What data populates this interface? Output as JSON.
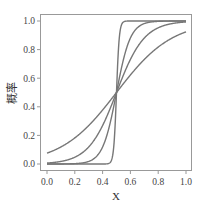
{
  "chart_data": {
    "type": "line",
    "title": "",
    "xlabel": "X",
    "ylabel": "概率",
    "xlim": [
      0.0,
      1.0
    ],
    "ylim": [
      0.0,
      1.0
    ],
    "x_ticks": [
      "0.0",
      "0.2",
      "0.4",
      "0.6",
      "0.8",
      "1.0"
    ],
    "y_ticks": [
      "0.0",
      "0.2",
      "0.4",
      "0.6",
      "0.8",
      "1.0"
    ],
    "grid": false,
    "legend": null,
    "line_color": "#777777",
    "function": "logistic sigmoid y = 1 / (1 + exp(-k (x - 0.5)))",
    "series": [
      {
        "name": "k=5",
        "k": 5,
        "x": [
          0.0,
          0.1,
          0.2,
          0.3,
          0.4,
          0.5,
          0.6,
          0.7,
          0.8,
          0.9,
          1.0
        ],
        "values": [
          0.076,
          0.119,
          0.182,
          0.269,
          0.378,
          0.5,
          0.622,
          0.731,
          0.818,
          0.881,
          0.924
        ]
      },
      {
        "name": "k=10",
        "k": 10,
        "x": [
          0.0,
          0.1,
          0.2,
          0.3,
          0.4,
          0.5,
          0.6,
          0.7,
          0.8,
          0.9,
          1.0
        ],
        "values": [
          0.007,
          0.018,
          0.047,
          0.119,
          0.269,
          0.5,
          0.731,
          0.881,
          0.953,
          0.982,
          0.993
        ]
      },
      {
        "name": "k=20",
        "k": 20,
        "x": [
          0.0,
          0.1,
          0.2,
          0.3,
          0.4,
          0.5,
          0.6,
          0.7,
          0.8,
          0.9,
          1.0
        ],
        "values": [
          0.0,
          0.0,
          0.002,
          0.018,
          0.119,
          0.5,
          0.881,
          0.982,
          0.998,
          1.0,
          1.0
        ]
      },
      {
        "name": "k=100",
        "k": 100,
        "x": [
          0.0,
          0.1,
          0.2,
          0.3,
          0.4,
          0.45,
          0.5,
          0.55,
          0.6,
          0.7,
          1.0
        ],
        "values": [
          0.0,
          0.0,
          0.0,
          0.0,
          0.0,
          0.007,
          0.5,
          0.993,
          1.0,
          1.0,
          1.0
        ]
      }
    ]
  }
}
